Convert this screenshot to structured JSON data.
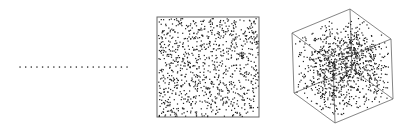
{
  "figure": {
    "colors": {
      "background": "#ffffff",
      "point": "#222222",
      "frame": "#666666"
    },
    "panels": [
      {
        "name": "1d-line",
        "dimension": 1,
        "point_count": 20,
        "x_range": [
          20,
          127
        ],
        "y": 67
      },
      {
        "name": "2d-square",
        "dimension": 2,
        "point_count": 1000,
        "box": {
          "x": 157,
          "y": 17,
          "width": 102,
          "height": 100
        },
        "seed": 7
      },
      {
        "name": "3d-cube",
        "dimension": 3,
        "point_count": 1000,
        "seed": 13,
        "vertices": {
          "origin": [
            294,
            93
          ],
          "ex": [
            41,
            30
          ],
          "ey": [
            58,
            -24
          ],
          "ez": [
            -2,
            -60
          ]
        }
      }
    ]
  }
}
